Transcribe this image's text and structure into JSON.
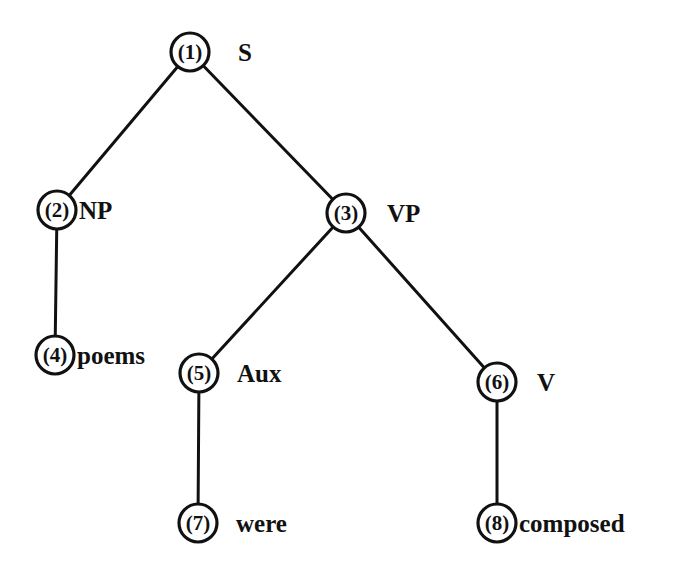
{
  "diagram": {
    "type": "parse-tree",
    "colors": {
      "ink": "#111111",
      "background": "#ffffff"
    },
    "nodes": [
      {
        "id": 1,
        "num": "(1)",
        "label": "S",
        "cx": 190,
        "cy": 52,
        "r": 19,
        "label_x": 238,
        "label_y": 61
      },
      {
        "id": 2,
        "num": "(2)",
        "label": "NP",
        "cx": 57,
        "cy": 210,
        "r": 19,
        "label_x": 79,
        "label_y": 219
      },
      {
        "id": 3,
        "num": "(3)",
        "label": "VP",
        "cx": 346,
        "cy": 213,
        "r": 19,
        "label_x": 387,
        "label_y": 222
      },
      {
        "id": 4,
        "num": "(4)",
        "label": "poems",
        "cx": 55,
        "cy": 355,
        "r": 19,
        "label_x": 77,
        "label_y": 364
      },
      {
        "id": 5,
        "num": "(5)",
        "label": "Aux",
        "cx": 199,
        "cy": 373,
        "r": 19,
        "label_x": 237,
        "label_y": 382
      },
      {
        "id": 6,
        "num": "(6)",
        "label": "V",
        "cx": 497,
        "cy": 382,
        "r": 19,
        "label_x": 537,
        "label_y": 391
      },
      {
        "id": 7,
        "num": "(7)",
        "label": "were",
        "cx": 198,
        "cy": 523,
        "r": 19,
        "label_x": 236,
        "label_y": 532
      },
      {
        "id": 8,
        "num": "(8)",
        "label": "composed",
        "cx": 497,
        "cy": 523,
        "r": 19,
        "label_x": 519,
        "label_y": 532
      }
    ],
    "edges": [
      {
        "from": 1,
        "to": 2
      },
      {
        "from": 1,
        "to": 3
      },
      {
        "from": 2,
        "to": 4
      },
      {
        "from": 3,
        "to": 5
      },
      {
        "from": 3,
        "to": 6
      },
      {
        "from": 5,
        "to": 7
      },
      {
        "from": 6,
        "to": 8
      }
    ]
  }
}
